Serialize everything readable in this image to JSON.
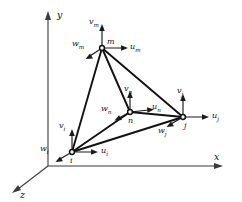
{
  "figure": {
    "background_color": "#ffffff",
    "line_color": "#121212",
    "axis_color": "#3a3a3a"
  },
  "axes": [
    {
      "name": "y-axis",
      "label": "y",
      "label_x": 57,
      "label_y": 10,
      "direction": "up"
    },
    {
      "name": "x-axis",
      "label": "x",
      "label_x": 214,
      "label_y": 152,
      "direction": "right"
    },
    {
      "name": "z-axis",
      "label": "z",
      "label_x": 20,
      "label_y": 190,
      "direction": "down-left"
    }
  ],
  "nodes": [
    {
      "id": "m",
      "label": "m",
      "x": 102,
      "y": 48,
      "label_x": 107,
      "label_y": 38
    },
    {
      "id": "n",
      "label": "n",
      "x": 130,
      "y": 112,
      "label_x": 128,
      "label_y": 117
    },
    {
      "id": "j",
      "label": "j",
      "x": 183,
      "y": 117,
      "label_x": 184,
      "label_y": 122
    },
    {
      "id": "i",
      "label": "i",
      "x": 72,
      "y": 152,
      "label_x": 70,
      "label_y": 157
    }
  ],
  "edges": [
    {
      "from": "m",
      "to": "i"
    },
    {
      "from": "m",
      "to": "j"
    },
    {
      "from": "m",
      "to": "n"
    },
    {
      "from": "i",
      "to": "j"
    },
    {
      "from": "i",
      "to": "n"
    },
    {
      "from": "n",
      "to": "j"
    }
  ],
  "vectors": [
    {
      "name": "v_m",
      "base": "v",
      "sub": "m",
      "node": "m",
      "dx": 0,
      "dy": -23,
      "label_x": 89,
      "label_y": 18
    },
    {
      "name": "u_m",
      "base": "u",
      "sub": "m",
      "node": "m",
      "dx": 25,
      "dy": 0,
      "label_x": 130,
      "label_y": 43
    },
    {
      "name": "w_m",
      "base": "w",
      "sub": "m",
      "node": "m",
      "dx": -16,
      "dy": 10,
      "label_x": 72,
      "label_y": 40
    },
    {
      "name": "v_n",
      "base": "v",
      "sub": "n",
      "node": "n",
      "dx": 0,
      "dy": -20,
      "label_x": 124,
      "label_y": 85
    },
    {
      "name": "u_n",
      "base": "u",
      "sub": "n",
      "node": "n",
      "dx": 23,
      "dy": -2,
      "label_x": 152,
      "label_y": 103
    },
    {
      "name": "w_n",
      "base": "w",
      "sub": "n",
      "node": "n",
      "dx": -15,
      "dy": 8,
      "label_x": 101,
      "label_y": 105
    },
    {
      "name": "v_j",
      "base": "v",
      "sub": "j",
      "node": "j",
      "dx": 0,
      "dy": -22,
      "label_x": 177,
      "label_y": 87
    },
    {
      "name": "u_j",
      "base": "u",
      "sub": "j",
      "node": "j",
      "dx": 26,
      "dy": 0,
      "label_x": 212,
      "label_y": 112
    },
    {
      "name": "w_j",
      "base": "w",
      "sub": "j",
      "node": "j",
      "dx": -16,
      "dy": 9,
      "label_x": 158,
      "label_y": 127
    },
    {
      "name": "v_i",
      "base": "v",
      "sub": "i",
      "node": "i",
      "dx": 0,
      "dy": -22,
      "label_x": 59,
      "label_y": 122
    },
    {
      "name": "u_i",
      "base": "u",
      "sub": "i",
      "node": "i",
      "dx": 25,
      "dy": 0,
      "label_x": 101,
      "label_y": 147
    },
    {
      "name": "w_i",
      "base": "w",
      "sub": "i",
      "node": "i",
      "dx": -16,
      "dy": 9,
      "label_x": 40,
      "label_y": 145
    }
  ]
}
